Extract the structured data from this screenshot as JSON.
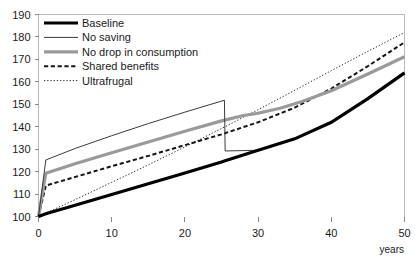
{
  "chart_data": {
    "type": "line",
    "title": "",
    "xlabel": "years",
    "ylabel": "",
    "xlim": [
      0,
      50
    ],
    "ylim": [
      100,
      190
    ],
    "xticks": [
      0,
      10,
      20,
      30,
      40,
      50
    ],
    "yticks": [
      100,
      110,
      120,
      130,
      140,
      150,
      160,
      170,
      180,
      190
    ],
    "xtick_labels": [
      "0",
      "10",
      "20",
      "30",
      "40",
      "50"
    ],
    "ytick_labels": [
      "100",
      "110",
      "120",
      "130",
      "140",
      "150",
      "160",
      "170",
      "180",
      "190"
    ],
    "grid": false,
    "legend_position": "top-left",
    "series": [
      {
        "name": "Baseline",
        "color": "#000000",
        "width": 3.2,
        "dash": "none",
        "x": [
          0,
          1,
          5,
          10,
          15,
          20,
          25,
          25.5,
          30,
          35,
          40,
          45,
          50
        ],
        "values": [
          100,
          101.2,
          105.0,
          109.8,
          114.6,
          119.4,
          124.3,
          124.8,
          129.5,
          134.6,
          142.0,
          152.5,
          164.0
        ]
      },
      {
        "name": "No saving",
        "color": "#3b3b3b",
        "width": 1.0,
        "dash": "none",
        "x": [
          0,
          1,
          5,
          10,
          15,
          20,
          25.4,
          25.5,
          30,
          35,
          40,
          45,
          50
        ],
        "values": [
          100,
          125.2,
          130.3,
          136.0,
          141.4,
          146.5,
          151.8,
          129.2,
          129.5,
          134.6,
          142.0,
          152.5,
          164.0
        ]
      },
      {
        "name": "No drop in consumption",
        "color": "#9a9a9a",
        "width": 3.2,
        "dash": "none",
        "x": [
          0,
          1,
          5,
          10,
          15,
          20,
          25,
          28,
          30,
          33,
          36,
          40,
          45,
          50
        ],
        "values": [
          100,
          119.3,
          123.5,
          128.4,
          133.2,
          138.0,
          142.6,
          145.0,
          146.0,
          148.2,
          151.2,
          156.0,
          163.5,
          171.2
        ]
      },
      {
        "name": "Shared benefits",
        "color": "#161616",
        "width": 2.0,
        "dash": "4.2,2.6",
        "x": [
          0,
          1,
          5,
          10,
          15,
          20,
          25,
          30,
          35,
          40,
          45,
          50
        ],
        "values": [
          100,
          113.8,
          117.6,
          122.4,
          127.0,
          131.8,
          136.6,
          142.0,
          148.5,
          157.0,
          167.0,
          177.6
        ]
      },
      {
        "name": "Ultrafrugal",
        "color": "#2b2b2b",
        "width": 1.0,
        "dash": "1.3,1.9",
        "x": [
          0,
          5,
          10,
          15,
          20,
          25,
          30,
          35,
          40,
          45,
          50
        ],
        "values": [
          100,
          107.5,
          115.2,
          123.0,
          131.0,
          139.2,
          147.6,
          156.2,
          165.0,
          173.6,
          182.0
        ]
      }
    ]
  },
  "legend": {
    "items": [
      {
        "label": "Baseline"
      },
      {
        "label": "No saving"
      },
      {
        "label": "No drop in consumption"
      },
      {
        "label": "Shared benefits"
      },
      {
        "label": "Ultrafrugal"
      }
    ]
  },
  "axis": {
    "x_caption": "years"
  }
}
